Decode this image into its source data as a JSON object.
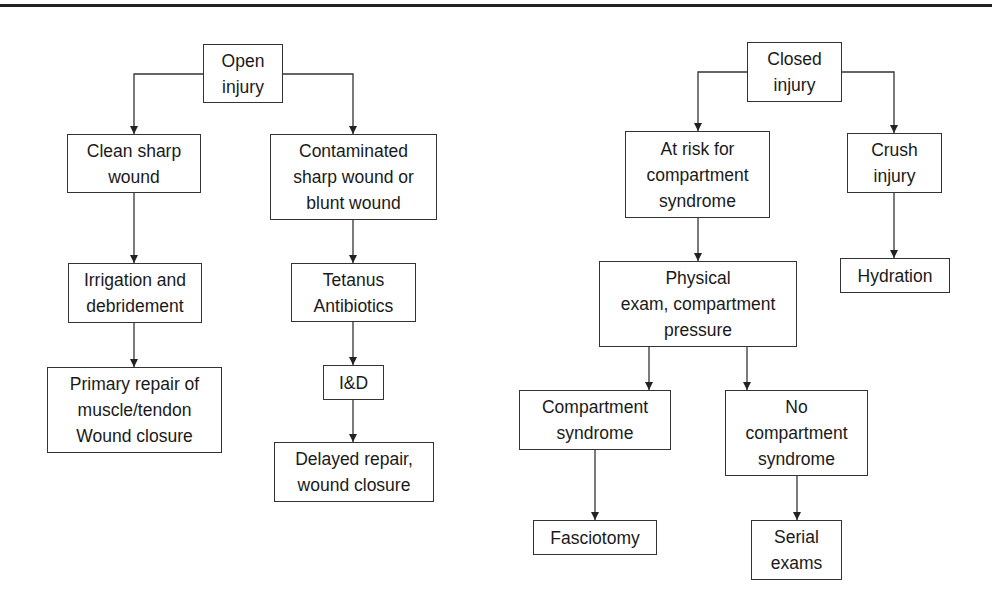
{
  "diagram": {
    "type": "flowchart",
    "left_tree": {
      "root": "Open\ninjury",
      "clean": "Clean sharp\nwound",
      "contaminated": "Contaminated\nsharp wound or\nblunt wound",
      "irrigation": "Irrigation and\ndebridement",
      "tetanus": "Tetanus\nAntibiotics",
      "primary_repair": "Primary repair of\nmuscle/tendon\nWound closure",
      "id": "I&D",
      "delayed_repair": "Delayed repair,\nwound closure"
    },
    "right_tree": {
      "root": "Closed\ninjury",
      "at_risk": "At risk for\ncompartment\nsyndrome",
      "crush": "Crush\ninjury",
      "hydration": "Hydration",
      "physical_exam": "Physical\nexam, compartment\npressure",
      "compartment_syndrome": "Compartment\nsyndrome",
      "no_compartment_syndrome": "No\ncompartment\nsyndrome",
      "fasciotomy": "Fasciotomy",
      "serial_exams": "Serial\nexams"
    },
    "edges": [
      [
        "Open injury",
        "Clean sharp wound"
      ],
      [
        "Open injury",
        "Contaminated sharp wound or blunt wound"
      ],
      [
        "Clean sharp wound",
        "Irrigation and debridement"
      ],
      [
        "Irrigation and debridement",
        "Primary repair of muscle/tendon Wound closure"
      ],
      [
        "Contaminated sharp wound or blunt wound",
        "Tetanus Antibiotics"
      ],
      [
        "Tetanus Antibiotics",
        "I&D"
      ],
      [
        "I&D",
        "Delayed repair, wound closure"
      ],
      [
        "Closed injury",
        "At risk for compartment syndrome"
      ],
      [
        "Closed injury",
        "Crush injury"
      ],
      [
        "Crush injury",
        "Hydration"
      ],
      [
        "At risk for compartment syndrome",
        "Physical exam, compartment pressure"
      ],
      [
        "Physical exam, compartment pressure",
        "Compartment syndrome"
      ],
      [
        "Physical exam, compartment pressure",
        "No compartment syndrome"
      ],
      [
        "Compartment syndrome",
        "Fasciotomy"
      ],
      [
        "No compartment syndrome",
        "Serial exams"
      ]
    ]
  }
}
